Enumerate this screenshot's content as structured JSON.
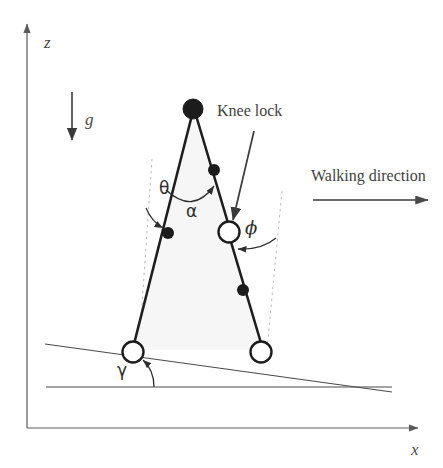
{
  "figure": {
    "background_color": "#ffffff",
    "ink_color": "#2e2e2e",
    "width": 443,
    "height": 468
  },
  "axes": {
    "z_label": "z",
    "x_label": "x",
    "z_axis_name": "vertical-axis",
    "x_axis_name": "horizontal-axis"
  },
  "gravity": {
    "label": "g",
    "direction": "down"
  },
  "annotations": {
    "knee_lock": "Knee lock",
    "walking_direction": "Walking direction"
  },
  "angles": [
    {
      "symbol": "θ",
      "name": "theta",
      "description": "stance leg angle from slope normal"
    },
    {
      "symbol": "α",
      "name": "alpha",
      "description": "inter-leg angle at hip"
    },
    {
      "symbol": "ϕ",
      "name": "phi",
      "description": "knee angle of swing leg"
    },
    {
      "symbol": "γ",
      "name": "gamma",
      "description": "slope inclination angle"
    }
  ],
  "joints": [
    {
      "name": "hip",
      "style": "filled",
      "x": 193,
      "y": 109,
      "r": 10
    },
    {
      "name": "knee",
      "style": "open",
      "x": 229,
      "y": 232,
      "r": 11
    },
    {
      "name": "stance-foot",
      "style": "open",
      "x": 133,
      "y": 352,
      "r": 11
    },
    {
      "name": "swing-foot",
      "style": "open",
      "x": 261,
      "y": 352,
      "r": 11
    }
  ],
  "point_masses": [
    {
      "name": "stance-leg-mass",
      "x": 168,
      "y": 233,
      "r": 6
    },
    {
      "name": "swing-thigh-mass",
      "x": 214,
      "y": 170,
      "r": 6
    },
    {
      "name": "swing-shank-mass",
      "x": 243,
      "y": 290,
      "r": 6
    }
  ],
  "ground": {
    "slope_name": "slope-line",
    "horizontal_name": "horizontal-reference-line"
  }
}
